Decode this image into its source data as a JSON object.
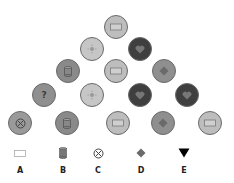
{
  "puzzle": {
    "circles": [
      {
        "row": 1,
        "x": 116,
        "y": 27,
        "fill": "#bdbdbd",
        "icon": "rectangle-icon"
      },
      {
        "row": 2,
        "x": 92,
        "y": 49,
        "fill": "#c6c6c6",
        "icon": "sun-icon"
      },
      {
        "row": 2,
        "x": 140,
        "y": 49,
        "fill": "#3f3f3f",
        "icon": "heart-icon"
      },
      {
        "row": 3,
        "x": 68,
        "y": 71,
        "fill": "#8a8a8a",
        "icon": "cylinder-icon"
      },
      {
        "row": 3,
        "x": 116,
        "y": 71,
        "fill": "#bdbdbd",
        "icon": "rectangle-icon"
      },
      {
        "row": 3,
        "x": 164,
        "y": 71,
        "fill": "#8f8f8f",
        "icon": "diamond-icon"
      },
      {
        "row": 4,
        "x": 44,
        "y": 95,
        "fill": "#8f8f8f",
        "icon": "question-icon",
        "text": "?"
      },
      {
        "row": 4,
        "x": 92,
        "y": 95,
        "fill": "#c6c6c6",
        "icon": "sun-icon"
      },
      {
        "row": 4,
        "x": 140,
        "y": 95,
        "fill": "#3f3f3f",
        "icon": "heart-icon"
      },
      {
        "row": 4,
        "x": 187,
        "y": 95,
        "fill": "#3f3f3f",
        "icon": "heart-icon"
      },
      {
        "row": 5,
        "x": 20,
        "y": 123,
        "fill": "#9a9a9a",
        "icon": "circle-x-icon"
      },
      {
        "row": 5,
        "x": 67,
        "y": 123,
        "fill": "#8a8a8a",
        "icon": "cylinder-icon"
      },
      {
        "row": 5,
        "x": 118,
        "y": 123,
        "fill": "#bdbdbd",
        "icon": "rectangle-icon"
      },
      {
        "row": 5,
        "x": 163,
        "y": 123,
        "fill": "#8f8f8f",
        "icon": "diamond-icon"
      },
      {
        "row": 5,
        "x": 210,
        "y": 123,
        "fill": "#bdbdbd",
        "icon": "rectangle-icon"
      }
    ]
  },
  "options": [
    {
      "label": "A",
      "icon": "rectangle-icon",
      "x": 20
    },
    {
      "label": "B",
      "icon": "cylinder-icon",
      "x": 63
    },
    {
      "label": "C",
      "icon": "circle-x-icon",
      "x": 98
    },
    {
      "label": "D",
      "icon": "diamond-icon",
      "x": 141
    },
    {
      "label": "E",
      "icon": "triangle-down-icon",
      "x": 184
    }
  ]
}
